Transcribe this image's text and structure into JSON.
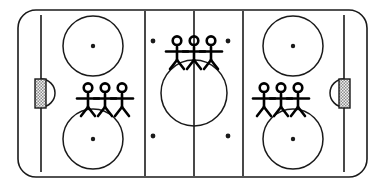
{
  "figure": {
    "canvas": {
      "width": 385,
      "height": 195
    },
    "colors": {
      "ice": "#ffffff",
      "line": "#1a1a1a",
      "goal_hatch_light": "#e8e8e8",
      "goal_hatch_dark": "#8c8c8c",
      "figure": "#000000"
    }
  },
  "rink": {
    "name": "rink-boundary",
    "x": 18,
    "y": 10,
    "width": 349,
    "height": 167,
    "corner_radius": 18,
    "stroke_width": 1.6
  },
  "lines": {
    "goal_lines": [
      {
        "label": "left-goal-line",
        "x": 41,
        "y1": 15,
        "y2": 172
      },
      {
        "label": "right-goal-line",
        "x": 344,
        "y1": 15,
        "y2": 172
      }
    ],
    "blue_lines": [
      {
        "label": "left-blue-line",
        "x": 145,
        "y1": 11,
        "y2": 176
      },
      {
        "label": "right-blue-line",
        "x": 243,
        "y1": 11,
        "y2": 176
      }
    ],
    "center_line": {
      "label": "center-line",
      "x": 194,
      "y1": 11,
      "y2": 176
    },
    "stroke_width": 1.6
  },
  "center_circle": {
    "label": "center-faceoff-circle",
    "cx": 194,
    "cy": 93,
    "r": 33
  },
  "faceoff_circles": [
    {
      "label": "faceoff-circle-upper-left",
      "cx": 93,
      "cy": 46,
      "r": 30,
      "dot_r": 2.2
    },
    {
      "label": "faceoff-circle-lower-left",
      "cx": 93,
      "cy": 139,
      "r": 30,
      "dot_r": 2.2
    },
    {
      "label": "faceoff-circle-upper-right",
      "cx": 293,
      "cy": 46,
      "r": 30,
      "dot_r": 2.2
    },
    {
      "label": "faceoff-circle-lower-right",
      "cx": 293,
      "cy": 139,
      "r": 30,
      "dot_r": 2.2
    }
  ],
  "neutral_zone_dots": [
    {
      "label": "neutral-dot-upper-left",
      "cx": 153,
      "cy": 41,
      "r": 2.4
    },
    {
      "label": "neutral-dot-upper-right",
      "cx": 228,
      "cy": 41,
      "r": 2.4
    },
    {
      "label": "neutral-dot-lower-left",
      "cx": 153,
      "cy": 136,
      "r": 2.4
    },
    {
      "label": "neutral-dot-lower-right",
      "cx": 228,
      "cy": 136,
      "r": 2.4
    }
  ],
  "goals": [
    {
      "label": "left-goal",
      "net": {
        "x": 35,
        "y": 79,
        "width": 11,
        "height": 29
      },
      "crease": {
        "cx": 41,
        "cy": 93,
        "r": 14,
        "opens": "right"
      }
    },
    {
      "label": "right-goal",
      "net": {
        "x": 339,
        "y": 79,
        "width": 11,
        "height": 29
      },
      "crease": {
        "cx": 344,
        "cy": 93,
        "r": 14,
        "opens": "left"
      }
    }
  ],
  "player_groups": [
    {
      "label": "player-group-left-zone",
      "zone": "left defensive zone",
      "count": 3,
      "x": 105,
      "y": 93,
      "scale": 1.0
    },
    {
      "label": "player-group-center-ice",
      "zone": "neutral zone at center line",
      "count": 3,
      "x": 194,
      "y": 46,
      "scale": 1.0
    },
    {
      "label": "player-group-right-zone",
      "zone": "right defensive zone",
      "count": 3,
      "x": 281,
      "y": 93,
      "scale": 1.0
    }
  ],
  "figure_geometry": {
    "spacing": 17,
    "head_r": 4.3,
    "body_top": 1,
    "body_bottom": 14,
    "arm_y": 5.5,
    "arm_span": 11,
    "leg_spread": 7,
    "leg_bottom": 23,
    "stroke_width": 2.6
  }
}
